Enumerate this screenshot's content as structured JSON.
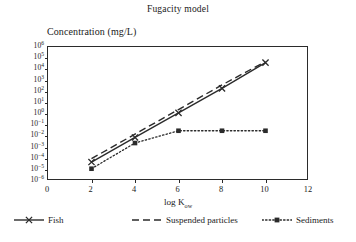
{
  "chart_data": {
    "type": "line",
    "title": "Fugacity model",
    "xlabel": "log Kow",
    "xlabel_base": "log K",
    "xlabel_sub": "ow",
    "ylabel": "Concentration (mg/L)",
    "xlim": [
      0,
      12
    ],
    "xticks": [
      0,
      2,
      4,
      6,
      8,
      10,
      12
    ],
    "xtick_labels": [
      "0",
      "2",
      "4",
      "6",
      "8",
      "10",
      "12"
    ],
    "ylim_log10": [
      -6,
      6
    ],
    "yticks_log10": [
      6,
      5,
      4,
      3,
      2,
      1,
      0,
      -1,
      -2,
      -3,
      -4,
      -5,
      -6
    ],
    "ytick_labels": [
      "10⁶",
      "10⁵",
      "10⁴",
      "10³",
      "10²",
      "10¹",
      "10⁰",
      "10⁻¹",
      "10⁻²",
      "10⁻³",
      "10⁻⁴",
      "10⁻⁵",
      "10⁻⁶"
    ],
    "ytick_mantissa": "10",
    "ytick_exponents": [
      "6",
      "5",
      "4",
      "3",
      "2",
      "1",
      "0",
      "−1",
      "−2",
      "−3",
      "−4",
      "−5",
      "−6"
    ],
    "grid": false,
    "legend_position": "bottom",
    "series": [
      {
        "name": "Fish",
        "style": "solid",
        "marker": "x",
        "x": [
          2,
          4,
          6,
          8,
          10
        ],
        "y_log10": [
          -4.3,
          -2.1,
          0.1,
          2.3,
          4.6
        ]
      },
      {
        "name": "Suspended particles",
        "style": "dashed",
        "marker": "none",
        "x": [
          2,
          4,
          6,
          8,
          10
        ],
        "y_log10": [
          -4.0,
          -1.8,
          0.4,
          2.6,
          4.7
        ]
      },
      {
        "name": "Sediments",
        "style": "dotted",
        "marker": "square",
        "x": [
          2,
          4,
          6,
          8,
          10
        ],
        "y_log10": [
          -4.9,
          -2.6,
          -1.5,
          -1.5,
          -1.5
        ]
      }
    ]
  },
  "legend": {
    "items": [
      {
        "label": "Fish",
        "style": "solid",
        "marker": "x"
      },
      {
        "label": "Suspended particles",
        "style": "dashed",
        "marker": "none"
      },
      {
        "label": "Sediments",
        "style": "dotted",
        "marker": "square"
      }
    ]
  },
  "colors": {
    "ink": "#2b2b2b",
    "background": "#ffffff"
  }
}
